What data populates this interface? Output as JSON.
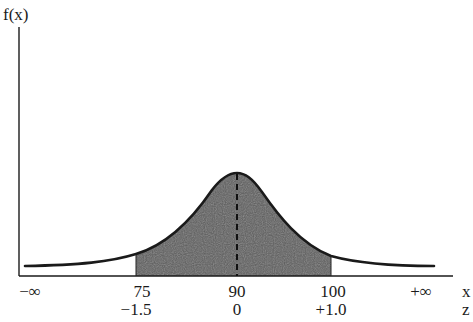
{
  "diagram": {
    "type": "normal-distribution",
    "y_axis_label": "f(x)",
    "x_axis_row_label": "x",
    "z_axis_row_label": "z",
    "x_ticks": [
      {
        "label": "−∞",
        "pos": 30
      },
      {
        "label": "75",
        "pos": 136
      },
      {
        "label": "90",
        "pos": 237
      },
      {
        "label": "100",
        "pos": 331
      },
      {
        "label": "+∞",
        "pos": 421
      }
    ],
    "z_ticks": [
      {
        "label": "−1.5",
        "pos": 136
      },
      {
        "label": "0",
        "pos": 237
      },
      {
        "label": "+1.0",
        "pos": 331
      }
    ],
    "distribution": {
      "mean": 90,
      "shaded_from_x": 75,
      "shaded_to_x": 100,
      "shaded_from_z": -1.5,
      "shaded_to_z": 1.0
    },
    "colors": {
      "line": "#1a1a1a",
      "shade": "#555555",
      "background": "#ffffff"
    }
  }
}
